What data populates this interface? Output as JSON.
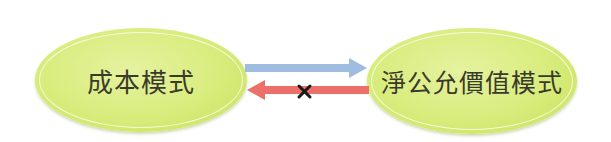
{
  "diagram": {
    "nodes": [
      {
        "id": "cost-model",
        "label": "成本模式"
      },
      {
        "id": "fair-value-model",
        "label": "淨公允價值模式"
      }
    ],
    "edges": [
      {
        "from": "cost-model",
        "to": "fair-value-model",
        "color": "#9fbde0",
        "allowed": true
      },
      {
        "from": "fair-value-model",
        "to": "cost-model",
        "color": "#ec6f6a",
        "allowed": false,
        "marker": "×"
      }
    ],
    "colors": {
      "node_fill": "#d8ec7c",
      "arrow_forward": "#9fbde0",
      "arrow_backward": "#ec6f6a",
      "cross_mark": "#1a1a1a"
    }
  }
}
